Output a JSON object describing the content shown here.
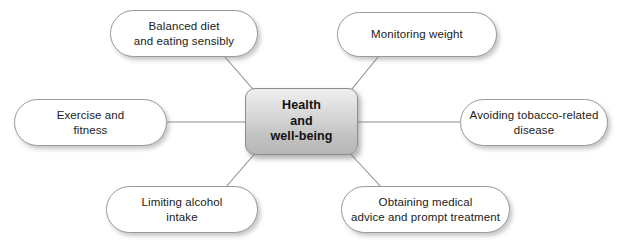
{
  "diagram": {
    "type": "spider-mind-map",
    "center": {
      "label": "Health\nand\nwell-being",
      "lines": [
        "Health",
        "and",
        "well-being"
      ]
    },
    "nodes": [
      {
        "id": "balanced-diet",
        "label": "Balanced diet\nand eating sensibly",
        "position": "top-left"
      },
      {
        "id": "monitoring-weight",
        "label": "Monitoring weight",
        "position": "top-right"
      },
      {
        "id": "exercise-fitness",
        "label": "Exercise and\nfitness",
        "position": "middle-left"
      },
      {
        "id": "avoiding-tobacco",
        "label": "Avoiding tobacco-related\ndisease",
        "position": "middle-right"
      },
      {
        "id": "limiting-alcohol",
        "label": "Limiting alcohol\nintake",
        "position": "bottom-left"
      },
      {
        "id": "obtaining-medical",
        "label": "Obtaining medical\nadvice and prompt treatment",
        "position": "bottom-right"
      }
    ],
    "colors": {
      "connector": "#8c8c8c",
      "node_border": "#9a9a9a",
      "node_fill": "#ffffff",
      "center_fill_top": "#efefef",
      "center_fill_bottom": "#b6b6b6",
      "text": "#1b1b1b",
      "background": "#ffffff"
    }
  }
}
